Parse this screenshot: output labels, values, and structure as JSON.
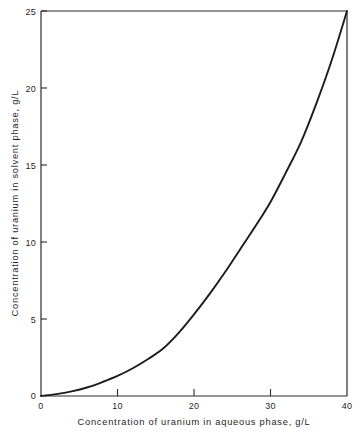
{
  "chart_data": {
    "type": "line",
    "title": "",
    "subtitle": "",
    "xlabel": "Concentration of uranium in aqueous phase,    g/L",
    "ylabel": "Concentration of uranium in solvent phase,    g/L",
    "xlim": [
      0,
      40
    ],
    "ylim": [
      0,
      25
    ],
    "grid": false,
    "legend": false,
    "legend_position": "none",
    "xticks": [
      0,
      10,
      20,
      30,
      40
    ],
    "xtick_labels": [
      "0",
      "10",
      "20",
      "30",
      "40"
    ],
    "yticks": [
      0,
      5,
      10,
      15,
      20,
      25
    ],
    "ytick_labels": [
      "0",
      "5",
      "10",
      "15",
      "20",
      "25"
    ],
    "x_units": "g/L",
    "y_units": "g/L",
    "series": [
      {
        "name": "uranium distribution equilibrium curve",
        "x": [
          0,
          2,
          4,
          6,
          8,
          10,
          12,
          14,
          16,
          18,
          20,
          22,
          24,
          26,
          28,
          30,
          32,
          34,
          36,
          38,
          40
        ],
        "y": [
          0.0,
          0.12,
          0.3,
          0.55,
          0.9,
          1.3,
          1.8,
          2.4,
          3.1,
          4.1,
          5.3,
          6.6,
          8.0,
          9.5,
          11.0,
          12.6,
          14.5,
          16.5,
          19.0,
          21.8,
          25.0
        ]
      }
    ],
    "annotations": []
  },
  "axes": {
    "x_tick_label_0": "0",
    "x_tick_label_1": "10",
    "x_tick_label_2": "20",
    "x_tick_label_3": "30",
    "x_tick_label_4": "40",
    "y_tick_label_0": "0",
    "y_tick_label_1": "5",
    "y_tick_label_2": "10",
    "y_tick_label_3": "15",
    "y_tick_label_4": "20",
    "y_tick_label_5": "25",
    "x_axis_title": "Concentration  of  uranium  in  aqueous  phase,      g/L",
    "y_axis_title": "Concentration  of  uranium  in  solvent  phase,      g/L"
  },
  "colors": {
    "background": "#ffffff",
    "frame": "#2b2b2b",
    "curve": "#1c1c1c",
    "text": "#1f1f1f"
  }
}
